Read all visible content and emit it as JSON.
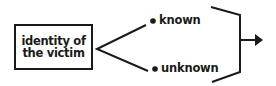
{
  "diagram": {
    "source_box": {
      "line1": "identity of",
      "line2": "the victim"
    },
    "branches": [
      {
        "label": "known"
      },
      {
        "label": "unknown"
      }
    ],
    "colors": {
      "ink": "#1a1a1a",
      "background": "#ffffff"
    }
  }
}
